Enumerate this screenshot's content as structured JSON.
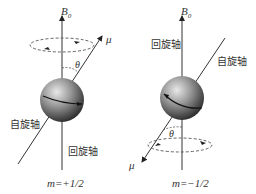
{
  "diagrams": [
    {
      "id": "left",
      "field_label": "B",
      "field_sub": "0",
      "mu_label": "μ",
      "theta_label": "θ",
      "spin_axis_label": "自旋轴",
      "precession_axis_label": "回旋轴",
      "m_label": "m=+1/2"
    },
    {
      "id": "right",
      "field_label": "B",
      "field_sub": "0",
      "mu_label": "μ",
      "theta_label": "θ",
      "spin_axis_label": "自旋轴",
      "precession_axis_label": "回旋轴",
      "m_label": "m=−1/2"
    }
  ],
  "colors": {
    "line": "#333333",
    "sphere_light": "#cfcfcf",
    "sphere_dark": "#3a3a3a",
    "dash": "#555555"
  }
}
